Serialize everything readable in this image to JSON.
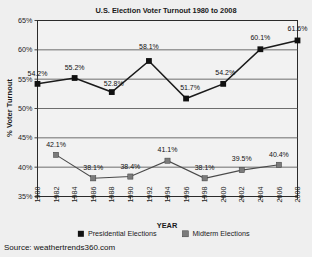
{
  "source_note": "Source: weathertrends360.com",
  "chart_data": {
    "type": "line",
    "title": "U.S. Election Voter Turnout 1980 to 2008",
    "xlabel": "YEAR",
    "ylabel": "% Voter Turnout",
    "ylim": [
      35,
      65
    ],
    "ytick_step": 5,
    "yticks": [
      "35%",
      "40%",
      "45%",
      "50%",
      "55%",
      "60%",
      "65%"
    ],
    "ytick_values": [
      35,
      40,
      45,
      50,
      55,
      60,
      65
    ],
    "xlim": [
      1980,
      2008
    ],
    "xticks": [
      "1980",
      "1982",
      "1984",
      "1986",
      "1988",
      "1990",
      "1992",
      "1994",
      "1996",
      "1998",
      "2000",
      "2002",
      "2004",
      "2006",
      "2008"
    ],
    "xtick_values": [
      1980,
      1982,
      1984,
      1986,
      1988,
      1990,
      1992,
      1994,
      1996,
      1998,
      2000,
      2002,
      2004,
      2006,
      2008
    ],
    "grid": "horizontal",
    "legend_position": "bottom",
    "series": [
      {
        "name": "Presidential Elections",
        "marker": "filled-square-dark",
        "color": "#111111",
        "x": [
          1980,
          1984,
          1988,
          1992,
          1996,
          2000,
          2004,
          2008
        ],
        "values": [
          54.2,
          55.2,
          52.8,
          58.1,
          51.7,
          54.2,
          60.1,
          61.6
        ],
        "labels": [
          "54.2%",
          "55.2%",
          "52.8%",
          "58.1%",
          "51.7%",
          "54.2%",
          "60.1%",
          "61.6%"
        ]
      },
      {
        "name": "Midterm Elections",
        "marker": "filled-square-gray",
        "color": "#7b7b7b",
        "x": [
          1982,
          1986,
          1990,
          1994,
          1998,
          2002,
          2006
        ],
        "values": [
          42.1,
          38.1,
          38.4,
          41.1,
          38.1,
          39.5,
          40.4
        ],
        "labels": [
          "42.1%",
          "38.1%",
          "38.4%",
          "41.1%",
          "38.1%",
          "39.5%",
          "40.4%"
        ]
      }
    ]
  }
}
